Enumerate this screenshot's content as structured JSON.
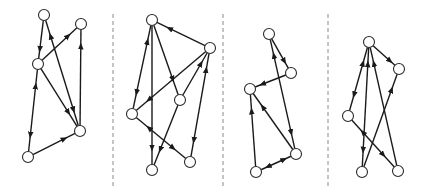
{
  "figure": {
    "width": 429,
    "height": 189,
    "node_radius": 5.5,
    "colors": {
      "edge": "#1a1a1a",
      "node_fill": "#ffffff",
      "node_stroke": "#2a2a2a",
      "separator": "#8a8a8a"
    },
    "separators": [
      {
        "x": 113,
        "y1": 14,
        "y2": 186
      },
      {
        "x": 223,
        "y1": 14,
        "y2": 186
      },
      {
        "x": 328,
        "y1": 14,
        "y2": 186
      }
    ],
    "panels": [
      {
        "id": "graph-1",
        "nodes": [
          {
            "id": "A",
            "x": 44,
            "y": 15
          },
          {
            "id": "B",
            "x": 81,
            "y": 24
          },
          {
            "id": "C",
            "x": 38,
            "y": 64
          },
          {
            "id": "D",
            "x": 80,
            "y": 131
          },
          {
            "id": "E",
            "x": 28,
            "y": 157
          }
        ],
        "edges": [
          {
            "from": "A",
            "to": "C",
            "bidirectional": false
          },
          {
            "from": "A",
            "to": "D",
            "bidirectional": true
          },
          {
            "from": "C",
            "to": "B",
            "bidirectional": false
          },
          {
            "from": "D",
            "to": "B",
            "bidirectional": false
          },
          {
            "from": "C",
            "to": "D",
            "bidirectional": false
          },
          {
            "from": "C",
            "to": "E",
            "bidirectional": true
          },
          {
            "from": "E",
            "to": "D",
            "bidirectional": false
          }
        ]
      },
      {
        "id": "graph-2",
        "nodes": [
          {
            "id": "A",
            "x": 152,
            "y": 20
          },
          {
            "id": "B",
            "x": 210,
            "y": 48
          },
          {
            "id": "C",
            "x": 180,
            "y": 100
          },
          {
            "id": "D",
            "x": 132,
            "y": 114
          },
          {
            "id": "E",
            "x": 152,
            "y": 170
          },
          {
            "id": "F",
            "x": 190,
            "y": 162
          }
        ],
        "edges": [
          {
            "from": "B",
            "to": "A",
            "bidirectional": false
          },
          {
            "from": "A",
            "to": "D",
            "bidirectional": true
          },
          {
            "from": "A",
            "to": "E",
            "bidirectional": false
          },
          {
            "from": "A",
            "to": "C",
            "bidirectional": false
          },
          {
            "from": "B",
            "to": "D",
            "bidirectional": false
          },
          {
            "from": "C",
            "to": "B",
            "bidirectional": false
          },
          {
            "from": "C",
            "to": "E",
            "bidirectional": false
          },
          {
            "from": "D",
            "to": "F",
            "bidirectional": true
          },
          {
            "from": "B",
            "to": "F",
            "bidirectional": true
          }
        ]
      },
      {
        "id": "graph-3",
        "nodes": [
          {
            "id": "A",
            "x": 269,
            "y": 34
          },
          {
            "id": "B",
            "x": 291,
            "y": 73
          },
          {
            "id": "C",
            "x": 250,
            "y": 89
          },
          {
            "id": "D",
            "x": 296,
            "y": 154
          },
          {
            "id": "E",
            "x": 256,
            "y": 172
          }
        ],
        "edges": [
          {
            "from": "A",
            "to": "B",
            "bidirectional": false
          },
          {
            "from": "B",
            "to": "C",
            "bidirectional": false
          },
          {
            "from": "A",
            "to": "D",
            "bidirectional": true
          },
          {
            "from": "D",
            "to": "C",
            "bidirectional": false
          },
          {
            "from": "E",
            "to": "C",
            "bidirectional": false
          },
          {
            "from": "E",
            "to": "D",
            "bidirectional": true
          }
        ]
      },
      {
        "id": "graph-4",
        "nodes": [
          {
            "id": "A",
            "x": 369,
            "y": 42
          },
          {
            "id": "B",
            "x": 399,
            "y": 69
          },
          {
            "id": "C",
            "x": 348,
            "y": 116
          },
          {
            "id": "D",
            "x": 362,
            "y": 172
          },
          {
            "id": "E",
            "x": 398,
            "y": 171
          }
        ],
        "edges": [
          {
            "from": "A",
            "to": "B",
            "bidirectional": false
          },
          {
            "from": "A",
            "to": "C",
            "bidirectional": true
          },
          {
            "from": "A",
            "to": "D",
            "bidirectional": true
          },
          {
            "from": "E",
            "to": "A",
            "bidirectional": false
          },
          {
            "from": "D",
            "to": "B",
            "bidirectional": false
          },
          {
            "from": "C",
            "to": "E",
            "bidirectional": true
          }
        ]
      }
    ]
  }
}
